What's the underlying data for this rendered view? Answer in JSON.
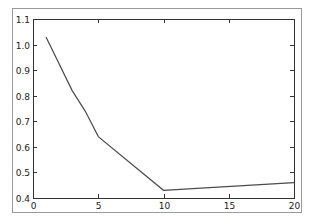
{
  "chart_data": {
    "type": "line",
    "title": "",
    "xlabel": "",
    "ylabel": "",
    "xlim": [
      0,
      20
    ],
    "ylim": [
      0.4,
      1.1
    ],
    "grid": false,
    "legend": null,
    "x_ticks": [
      "0",
      "5",
      "10",
      "15",
      "20"
    ],
    "y_ticks": [
      "0.4",
      "0.5",
      "0.6",
      "0.7",
      "0.8",
      "0.9",
      "1.0",
      "1.1"
    ],
    "series": [
      {
        "name": "series-1",
        "color": "#4a4a4a",
        "x": [
          1,
          3,
          4,
          5,
          10,
          20
        ],
        "y": [
          1.03,
          0.82,
          0.74,
          0.64,
          0.43,
          0.46
        ]
      }
    ]
  }
}
